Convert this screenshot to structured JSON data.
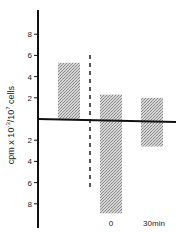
{
  "chart_data": {
    "type": "bar",
    "title": "",
    "xlabel": "",
    "ylabel": "cpm x 10^-3 / 10^7 cells",
    "ylabel_parts": {
      "base": "cpm x 10",
      "exp1": "-3",
      "sep": "/",
      "base2": "10",
      "exp2": "7",
      "unit": "cells"
    },
    "ylim": [
      -10,
      10
    ],
    "y_ticks_positive": [
      2,
      4,
      6,
      8
    ],
    "y_ticks_negative": [
      2,
      4,
      6,
      8
    ],
    "y_tick_note": "Ticks below zero labeled as positive magnitudes (2, 4, 6, 8) representing negative direction",
    "grid": false,
    "legend": null,
    "categories": [
      "baseline",
      "0",
      "30min"
    ],
    "x_tick_labels": [
      "",
      "0",
      "30min"
    ],
    "series": [
      {
        "name": "upper",
        "values": [
          5.3,
          2.3,
          2.0
        ]
      },
      {
        "name": "lower",
        "values": [
          0,
          -8.9,
          -2.6
        ]
      }
    ],
    "annotations": [
      {
        "type": "dashed-vertical-line",
        "position": "between baseline and 0"
      }
    ],
    "colors": {
      "bar_fill": "#b8b8b8",
      "axis": "#111111"
    }
  }
}
